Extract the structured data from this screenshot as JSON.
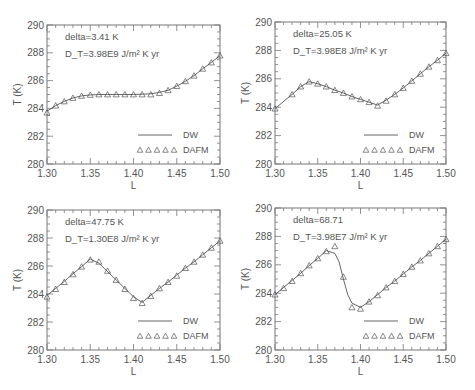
{
  "chart_data": [
    {
      "type": "line",
      "panel": "top-left",
      "annotations": [
        "delta=3.41 K",
        "D_T=3.98E9 J/m^2 K yr"
      ],
      "annotation_text": [
        "delta=3.41 K",
        "D_T=3.98E9 J/m² K yr"
      ],
      "xlabel": "L",
      "ylabel": "T (K)",
      "xlim": [
        1.3,
        1.5
      ],
      "ylim": [
        280,
        290
      ],
      "xticks": [
        "1.30",
        "1.35",
        "1.40",
        "1.45",
        "1.50"
      ],
      "yticks": [
        "280",
        "282",
        "284",
        "286",
        "288",
        "290"
      ],
      "legend": {
        "position": "bottom-right",
        "entries": [
          "DW",
          "DAFM"
        ]
      },
      "series": [
        {
          "name": "DW",
          "style": "line",
          "x": [
            1.3,
            1.31,
            1.32,
            1.33,
            1.34,
            1.35,
            1.36,
            1.37,
            1.38,
            1.39,
            1.4,
            1.41,
            1.42,
            1.43,
            1.44,
            1.45,
            1.46,
            1.47,
            1.48,
            1.49,
            1.5
          ],
          "y": [
            283.8,
            284.2,
            284.5,
            284.75,
            284.9,
            284.97,
            285.0,
            285.0,
            285.0,
            285.0,
            285.0,
            285.02,
            285.05,
            285.15,
            285.3,
            285.6,
            285.95,
            286.35,
            286.85,
            287.3,
            287.8
          ]
        },
        {
          "name": "DAFM",
          "style": "triangles",
          "x": [
            1.3,
            1.31,
            1.32,
            1.33,
            1.34,
            1.35,
            1.36,
            1.37,
            1.38,
            1.39,
            1.4,
            1.41,
            1.42,
            1.43,
            1.44,
            1.45,
            1.46,
            1.47,
            1.48,
            1.49,
            1.5
          ],
          "y": [
            283.7,
            284.2,
            284.5,
            284.75,
            284.9,
            284.97,
            285.0,
            285.0,
            285.0,
            285.0,
            285.0,
            285.0,
            285.0,
            285.1,
            285.3,
            285.6,
            285.95,
            286.35,
            286.85,
            287.3,
            287.8
          ]
        }
      ]
    },
    {
      "type": "line",
      "panel": "top-right",
      "annotation_text": [
        "delta=25.05 K",
        "D_T=3.98E8 J/m² K yr"
      ],
      "xlabel": "L",
      "ylabel": "T (K)",
      "xlim": [
        1.3,
        1.5
      ],
      "ylim": [
        280,
        290
      ],
      "xticks": [
        "1.30",
        "1.35",
        "1.40",
        "1.45",
        "1.50"
      ],
      "yticks": [
        "280",
        "282",
        "284",
        "286",
        "288",
        "290"
      ],
      "legend": {
        "position": "bottom-right",
        "entries": [
          "DW",
          "DAFM"
        ]
      },
      "series": [
        {
          "name": "DW",
          "style": "line",
          "x": [
            1.3,
            1.32,
            1.33,
            1.34,
            1.35,
            1.36,
            1.37,
            1.38,
            1.39,
            1.4,
            1.41,
            1.42,
            1.43,
            1.44,
            1.45,
            1.46,
            1.47,
            1.48,
            1.49,
            1.5
          ],
          "y": [
            283.9,
            284.9,
            285.45,
            285.8,
            285.65,
            285.45,
            285.2,
            285.0,
            284.75,
            284.55,
            284.35,
            284.15,
            284.5,
            284.9,
            285.35,
            285.85,
            286.35,
            286.85,
            287.3,
            287.8
          ]
        },
        {
          "name": "DAFM",
          "style": "triangles",
          "x": [
            1.3,
            1.32,
            1.33,
            1.34,
            1.35,
            1.36,
            1.37,
            1.38,
            1.39,
            1.4,
            1.41,
            1.42,
            1.43,
            1.44,
            1.45,
            1.46,
            1.47,
            1.48,
            1.49,
            1.5
          ],
          "y": [
            283.9,
            284.9,
            285.45,
            285.8,
            285.65,
            285.45,
            285.2,
            285.0,
            284.75,
            284.55,
            284.35,
            284.1,
            284.45,
            284.9,
            285.35,
            285.85,
            286.35,
            286.85,
            287.3,
            287.8
          ]
        }
      ]
    },
    {
      "type": "line",
      "panel": "bottom-left",
      "annotation_text": [
        "delta=47.75 K",
        "D_T=1.30E8 J/m² K yr"
      ],
      "xlabel": "L",
      "ylabel": "T (K)",
      "xlim": [
        1.3,
        1.5
      ],
      "ylim": [
        280,
        290
      ],
      "xticks": [
        "1.30",
        "1.35",
        "1.40",
        "1.45",
        "1.50"
      ],
      "yticks": [
        "280",
        "282",
        "284",
        "286",
        "288",
        "290"
      ],
      "legend": {
        "position": "bottom-right",
        "entries": [
          "DW",
          "DAFM"
        ]
      },
      "series": [
        {
          "name": "DW",
          "style": "line",
          "x": [
            1.3,
            1.31,
            1.32,
            1.33,
            1.34,
            1.35,
            1.36,
            1.37,
            1.38,
            1.39,
            1.4,
            1.41,
            1.42,
            1.43,
            1.44,
            1.45,
            1.46,
            1.47,
            1.48,
            1.49,
            1.5
          ],
          "y": [
            283.9,
            284.4,
            284.9,
            285.45,
            285.95,
            286.5,
            286.2,
            285.6,
            285.0,
            284.4,
            283.8,
            283.4,
            283.9,
            284.4,
            284.85,
            285.35,
            285.85,
            286.3,
            286.8,
            287.3,
            287.8
          ]
        },
        {
          "name": "DAFM",
          "style": "triangles",
          "x": [
            1.3,
            1.31,
            1.32,
            1.33,
            1.34,
            1.35,
            1.36,
            1.37,
            1.38,
            1.39,
            1.4,
            1.41,
            1.42,
            1.43,
            1.44,
            1.45,
            1.46,
            1.47,
            1.48,
            1.49,
            1.5
          ],
          "y": [
            283.8,
            284.35,
            284.85,
            285.4,
            285.95,
            286.45,
            286.3,
            285.65,
            285.0,
            284.35,
            283.7,
            283.35,
            283.85,
            284.4,
            284.85,
            285.3,
            285.85,
            286.3,
            286.8,
            287.3,
            287.8
          ]
        }
      ]
    },
    {
      "type": "line",
      "panel": "bottom-right",
      "annotation_text": [
        "delta=68.71",
        "D_T=3.98E7 J/m² K yr"
      ],
      "xlabel": "L",
      "ylabel": "T (K)",
      "xlim": [
        1.3,
        1.5
      ],
      "ylim": [
        280,
        290
      ],
      "xticks": [
        "1.30",
        "1.35",
        "1.40",
        "1.45",
        "1.50"
      ],
      "yticks": [
        "280",
        "282",
        "284",
        "286",
        "288",
        "290"
      ],
      "legend": {
        "position": "bottom-right",
        "entries": [
          "DW",
          "DAFM"
        ]
      },
      "series": [
        {
          "name": "DW",
          "style": "line",
          "x": [
            1.3,
            1.31,
            1.32,
            1.33,
            1.34,
            1.35,
            1.36,
            1.37,
            1.375,
            1.38,
            1.385,
            1.39,
            1.4,
            1.41,
            1.42,
            1.43,
            1.44,
            1.45,
            1.46,
            1.47,
            1.48,
            1.49,
            1.5
          ],
          "y": [
            283.9,
            284.4,
            284.9,
            285.4,
            285.95,
            286.45,
            287.0,
            286.8,
            286.2,
            285.0,
            283.9,
            283.3,
            283.0,
            283.4,
            283.9,
            284.4,
            284.85,
            285.35,
            285.85,
            286.3,
            286.8,
            287.3,
            287.8
          ]
        },
        {
          "name": "DAFM",
          "style": "triangles",
          "x": [
            1.3,
            1.31,
            1.32,
            1.33,
            1.34,
            1.35,
            1.36,
            1.37,
            1.38,
            1.39,
            1.4,
            1.41,
            1.42,
            1.43,
            1.44,
            1.45,
            1.46,
            1.47,
            1.48,
            1.49,
            1.5
          ],
          "y": [
            283.9,
            284.35,
            284.85,
            285.4,
            285.95,
            286.45,
            286.95,
            287.3,
            285.15,
            283.0,
            282.9,
            283.4,
            283.85,
            284.4,
            284.85,
            285.35,
            285.85,
            286.3,
            286.8,
            287.3,
            287.8
          ]
        }
      ]
    }
  ]
}
